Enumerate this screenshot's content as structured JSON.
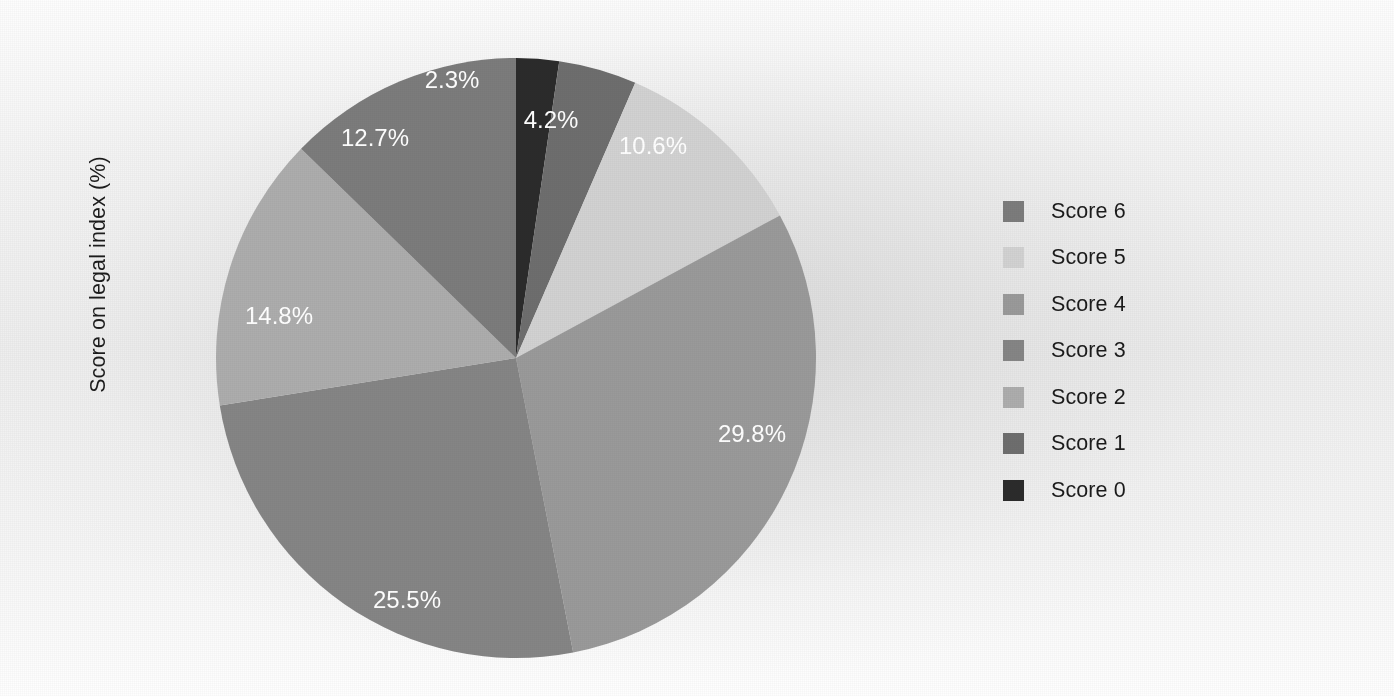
{
  "axis": {
    "y_label": "Score on legal index (%)"
  },
  "legend": {
    "position": "right",
    "items": [
      {
        "label": "Score 6",
        "color": "#7c7c7c"
      },
      {
        "label": "Score 5",
        "color": "#d2d2d2"
      },
      {
        "label": "Score 4",
        "color": "#9a9a9a"
      },
      {
        "label": "Score 3",
        "color": "#858585"
      },
      {
        "label": "Score 2",
        "color": "#adadad"
      },
      {
        "label": "Score 1",
        "color": "#6e6e6e"
      },
      {
        "label": "Score 0",
        "color": "#2b2b2b"
      }
    ]
  },
  "chart_data": {
    "type": "pie",
    "title": "",
    "xlabel": "",
    "ylabel": "Score on legal index (%)",
    "legend_position": "right",
    "grid": false,
    "start_angle_deg": 0,
    "direction": "clockwise",
    "categories": [
      "Score 0",
      "Score 1",
      "Score 5",
      "Score 4",
      "Score 3",
      "Score 2",
      "Score 6"
    ],
    "values": [
      2.3,
      4.2,
      10.6,
      29.8,
      25.5,
      14.8,
      12.7
    ],
    "labels": [
      "2.3%",
      "4.2%",
      "10.6%",
      "29.8%",
      "25.5%",
      "14.8%",
      "12.7%"
    ],
    "colors": [
      "#2b2b2b",
      "#6e6e6e",
      "#d2d2d2",
      "#9a9a9a",
      "#858585",
      "#adadad",
      "#7c7c7c"
    ],
    "slices": [
      {
        "category": "Score 0",
        "value": 2.3,
        "label": "2.3%",
        "color": "#2b2b2b"
      },
      {
        "category": "Score 1",
        "value": 4.2,
        "label": "4.2%",
        "color": "#6e6e6e"
      },
      {
        "category": "Score 5",
        "value": 10.6,
        "label": "10.6%",
        "color": "#d2d2d2"
      },
      {
        "category": "Score 4",
        "value": 29.8,
        "label": "29.8%",
        "color": "#9a9a9a"
      },
      {
        "category": "Score 3",
        "value": 25.5,
        "label": "25.5%",
        "color": "#858585"
      },
      {
        "category": "Score 2",
        "value": 14.8,
        "label": "14.8%",
        "color": "#adadad"
      },
      {
        "category": "Score 6",
        "value": 12.7,
        "label": "12.7%",
        "color": "#7c7c7c"
      }
    ],
    "geometry": {
      "cx": 516,
      "cy": 358,
      "r": 300
    },
    "label_positions": [
      {
        "label": "2.3%",
        "x": 452,
        "y": 82
      },
      {
        "label": "4.2%",
        "x": 551,
        "y": 122
      },
      {
        "label": "10.6%",
        "x": 653,
        "y": 148
      },
      {
        "label": "29.8%",
        "x": 752,
        "y": 436
      },
      {
        "label": "25.5%",
        "x": 407,
        "y": 602
      },
      {
        "label": "14.8%",
        "x": 279,
        "y": 318
      },
      {
        "label": "12.7%",
        "x": 375,
        "y": 140
      }
    ]
  }
}
